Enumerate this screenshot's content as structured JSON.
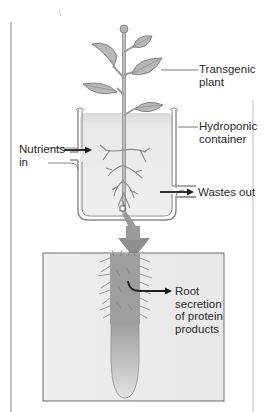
{
  "figure": {
    "type": "hydroponic-transgenic-plant-diagram",
    "labels": {
      "transgenic_plant": "Transgenic\nplant",
      "hydroponic_container": "Hydroponic\ncontainer",
      "nutrients_in": "Nutrients\nin",
      "wastes_out": "Wastes out",
      "root_secretion": "Root\nsecretion\nof protein\nproducts"
    },
    "colors": {
      "leaf": "#b9b9b9",
      "stem": "#a8a8a8",
      "container_fluid": "#e6e6e6",
      "panel_bg": "#ececec",
      "arrow_gray": "#8f8f8f",
      "arrow_dark": "#1e1e1e",
      "text": "#2a2a2a"
    }
  }
}
